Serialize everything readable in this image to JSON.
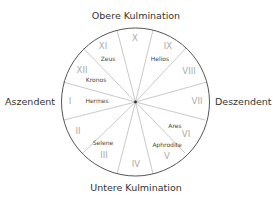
{
  "diagram": {
    "type": "horoscope-house-wheel",
    "center": [
      135.5,
      102
    ],
    "radius": 74,
    "colors": {
      "circle": "#555555",
      "spoke": "#bbbbbb",
      "house_number": "#aaaaaa",
      "planet": "#444444",
      "axis_label": "#333333"
    },
    "axis_labels": {
      "top": "Obere Kulmination",
      "bottom": "Untere Kulmination",
      "left": "Aszendent",
      "right": "Deszendent"
    },
    "spoke_endpoints": [
      [
        117,
        30
      ],
      [
        153,
        30
      ],
      [
        186,
        48
      ],
      [
        207,
        82
      ],
      [
        205,
        120
      ],
      [
        185,
        153
      ],
      [
        153,
        174
      ],
      [
        117,
        174
      ],
      [
        83,
        153
      ],
      [
        64,
        120
      ],
      [
        63,
        82
      ],
      [
        83,
        48
      ]
    ],
    "houses": [
      {
        "numeral": "I",
        "x": 70,
        "y": 104,
        "planet": "Hermes",
        "px": 97,
        "py": 103
      },
      {
        "numeral": "II",
        "x": 78,
        "y": 134,
        "planet": "",
        "px": 0,
        "py": 0
      },
      {
        "numeral": "III",
        "x": 104,
        "y": 158,
        "planet": "Selene",
        "px": 103,
        "py": 145
      },
      {
        "numeral": "IV",
        "x": 136,
        "y": 167,
        "planet": "",
        "px": 0,
        "py": 0
      },
      {
        "numeral": "V",
        "x": 167,
        "y": 159,
        "planet": "Aphrodite",
        "px": 167,
        "py": 147
      },
      {
        "numeral": "VI",
        "x": 186,
        "y": 137,
        "planet": "Ares",
        "px": 175,
        "py": 128
      },
      {
        "numeral": "VII",
        "x": 197,
        "y": 104,
        "planet": "",
        "px": 0,
        "py": 0
      },
      {
        "numeral": "VIII",
        "x": 189,
        "y": 74,
        "planet": "",
        "px": 0,
        "py": 0
      },
      {
        "numeral": "IX",
        "x": 168,
        "y": 49,
        "planet": "Helios",
        "px": 160,
        "py": 61
      },
      {
        "numeral": "X",
        "x": 135,
        "y": 41,
        "planet": "",
        "px": 0,
        "py": 0
      },
      {
        "numeral": "XI",
        "x": 103,
        "y": 49,
        "planet": "Zeus",
        "px": 108,
        "py": 61
      },
      {
        "numeral": "XII",
        "x": 82,
        "y": 73,
        "planet": "Kronos",
        "px": 96,
        "py": 82
      }
    ]
  }
}
